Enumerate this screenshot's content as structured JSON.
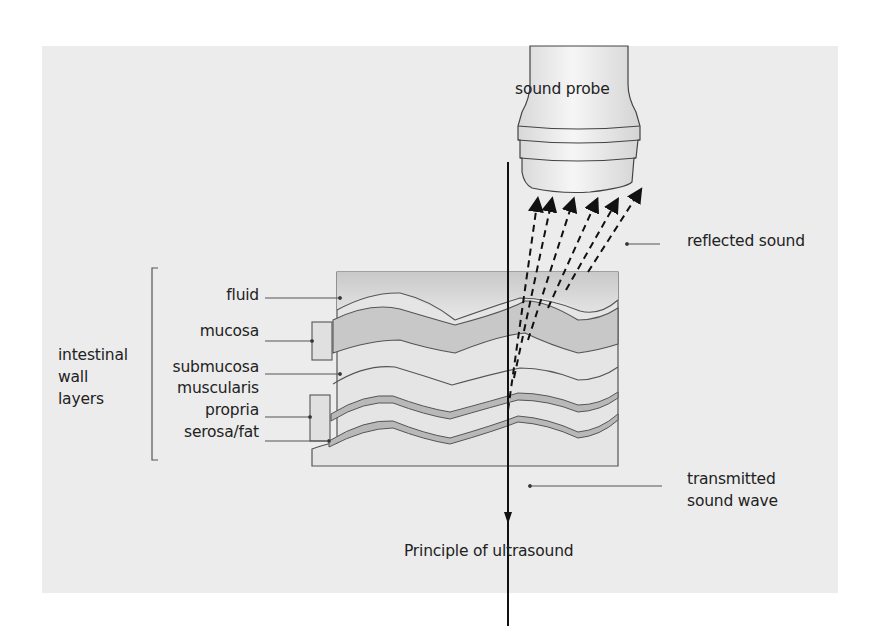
{
  "figure": {
    "caption": "Principle of ultrasound",
    "probe_label": "sound probe",
    "reflected_label": "reflected sound",
    "transmitted_label_line1": "transmitted",
    "transmitted_label_line2": "sound wave",
    "group_label_line1": "intestinal",
    "group_label_line2": "wall",
    "group_label_line3": "layers",
    "layers": [
      {
        "label": "fluid"
      },
      {
        "label": "mucosa"
      },
      {
        "label": "submucosa"
      },
      {
        "label": "muscularis"
      },
      {
        "label": "propria"
      },
      {
        "label": "serosa/fat"
      }
    ],
    "colors": {
      "background": "#ececec",
      "tissue_light": "#e6e6e6",
      "tissue_dark": "#c4c4c4",
      "stroke": "#555555",
      "arrow": "#111111"
    }
  }
}
